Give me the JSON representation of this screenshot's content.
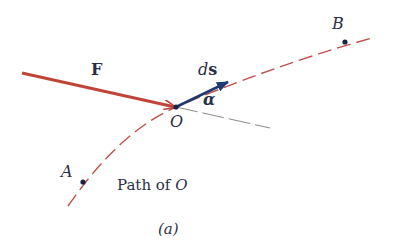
{
  "diagram": {
    "labels": {
      "force": "F",
      "displacement_d": "d",
      "displacement_s": "s",
      "angle": "α",
      "origin": "O",
      "point_a": "A",
      "point_b": "B",
      "path_text": "Path of ",
      "path_point": "O",
      "caption": "(a)"
    },
    "colors": {
      "force_arrow": "#c0443a",
      "displacement_arrow": "#1f3a6e",
      "path": "#c0504a",
      "tangent_line": "#8a8a8a",
      "text": "#2b2f45",
      "points": "#1a2440"
    }
  }
}
